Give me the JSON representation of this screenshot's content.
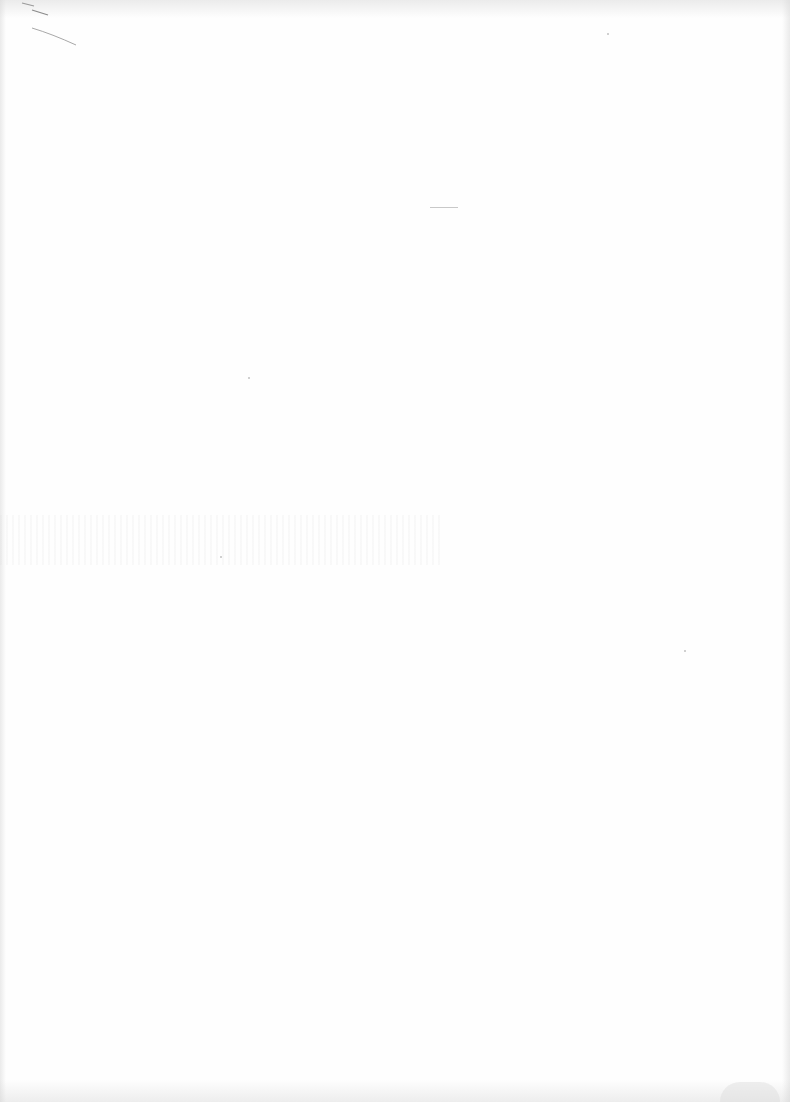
{
  "document": {
    "type": "blank scanned page",
    "text_content": ""
  }
}
